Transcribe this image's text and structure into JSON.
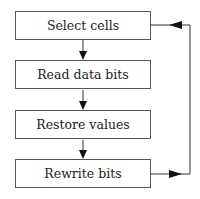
{
  "diagram": {
    "type": "flowchart",
    "steps": [
      {
        "label": "Select cells"
      },
      {
        "label": "Read data bits"
      },
      {
        "label": "Restore values"
      },
      {
        "label": "Rewrite bits"
      }
    ],
    "edges": [
      {
        "from": "Select cells",
        "to": "Read data bits"
      },
      {
        "from": "Read data bits",
        "to": "Restore values"
      },
      {
        "from": "Restore values",
        "to": "Rewrite bits"
      },
      {
        "from": "Rewrite bits",
        "to": "Select cells",
        "kind": "feedback-loop"
      }
    ],
    "colors": {
      "line": "#333333",
      "box_border": "#555555",
      "background": "#ffffff"
    }
  }
}
